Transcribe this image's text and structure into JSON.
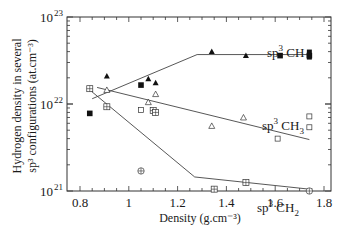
{
  "chart_data": {
    "type": "scatter",
    "title": "",
    "xlabel": "Density (g.cm⁻³)",
    "ylabel_line1": "Hydrogen density in several",
    "ylabel_line2": "sp³ configurations (at.cm⁻³)",
    "xlim": [
      0.8,
      1.8
    ],
    "ylim": [
      1e+21,
      1e+23
    ],
    "yscale": "log",
    "x_ticks": [
      "0.8",
      "1",
      "1.2",
      "1.4",
      "1.6",
      "1.8"
    ],
    "y_ticks": [
      {
        "base": "10",
        "exp": "21"
      },
      {
        "base": "10",
        "exp": "22"
      },
      {
        "base": "10",
        "exp": "23"
      }
    ],
    "grid": false,
    "series": [
      {
        "name": "sp3 CH",
        "label_text": "sp",
        "label_sup": "3",
        "label_rest": " CH",
        "marker": "filled-triangle",
        "points": [
          [
            0.91,
            2.1e+22
          ],
          [
            1.08,
            1.95e+22
          ],
          [
            1.11,
            1.75e+22
          ],
          [
            1.34,
            4e+22
          ],
          [
            1.48,
            3.6e+22
          ]
        ],
        "extra_markers": "filled-square",
        "extra_points": [
          [
            0.84,
            7.8e+21
          ],
          [
            1.05,
            1.65e+22
          ],
          [
            1.62,
            3.6e+22
          ],
          [
            1.74,
            3.6e+22
          ]
        ],
        "fit_line": [
          [
            0.85,
            1.15e+22
          ],
          [
            1.28,
            3.7e+22
          ],
          [
            1.74,
            3.7e+22
          ]
        ]
      },
      {
        "name": "sp3 CH3",
        "label_text": "sp",
        "label_sup": "3",
        "label_rest": " CH",
        "label_sub": "3",
        "marker": "open-triangle",
        "points": [
          [
            0.91,
            1.45e+22
          ],
          [
            1.08,
            1.05e+22
          ],
          [
            1.11,
            1.3e+22
          ],
          [
            1.34,
            5.6e+21
          ],
          [
            1.47,
            7e+21
          ]
        ],
        "extra_markers": "open-square",
        "extra_points": [
          [
            1.05,
            8.5e+21
          ],
          [
            1.61,
            4e+21
          ],
          [
            1.74,
            7.2e+21
          ],
          [
            1.74,
            5.4e+21
          ]
        ],
        "fit_line": [
          [
            0.87,
            1.55e+22
          ],
          [
            1.74,
            3.9e+21
          ]
        ]
      },
      {
        "name": "sp3 CH2",
        "label_text": "sp",
        "label_sup": "3",
        "label_rest": " CH",
        "label_sub": "2",
        "marker": "boxed-plus",
        "points": [
          [
            0.84,
            1.5e+22
          ],
          [
            0.91,
            9.3e+21
          ],
          [
            1.1,
            8.4e+21
          ],
          [
            1.11,
            8e+21
          ],
          [
            1.35,
            1.05e+21
          ],
          [
            1.48,
            1.25e+21
          ]
        ],
        "extra_markers": "circled-plus",
        "extra_points": [
          [
            1.05,
            1.7e+21
          ],
          [
            1.74,
            1e+21
          ]
        ],
        "fit_line": [
          [
            0.84,
            1.45e+22
          ],
          [
            1.27,
            1.45e+21
          ],
          [
            1.74,
            1.05e+21
          ]
        ]
      }
    ]
  }
}
